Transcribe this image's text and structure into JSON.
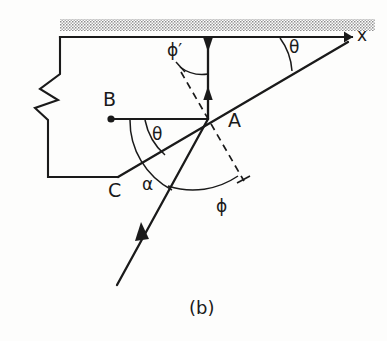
{
  "figure": {
    "caption": "(b)",
    "domain_type": "technical-line-diagram",
    "background_color": "#fdfdfc",
    "ink_color": "#1a1a1a",
    "hatch_color": "#9a9a9a",
    "labels": {
      "point_a": "A",
      "point_b": "B",
      "point_c": "C",
      "axis_x": "x",
      "angle_theta_upper": "θ",
      "angle_theta_lower": "θ",
      "angle_alpha": "α",
      "angle_phi": "ϕ",
      "angle_phi_prime": "ϕ′"
    },
    "label_positions": {
      "point_a": {
        "x": 228,
        "y": 111
      },
      "point_b": {
        "x": 103,
        "y": 90
      },
      "point_c": {
        "x": 108,
        "y": 181
      },
      "axis_x": {
        "x": 357,
        "y": 27
      },
      "angle_theta_upper": {
        "x": 289,
        "y": 39
      },
      "angle_theta_lower": {
        "x": 152,
        "y": 126
      },
      "angle_alpha": {
        "x": 142,
        "y": 176
      },
      "angle_phi": {
        "x": 216,
        "y": 198
      },
      "angle_phi_prime": {
        "x": 167,
        "y": 42
      }
    },
    "geometry": {
      "point_a": {
        "x": 208,
        "y": 119
      },
      "point_b": {
        "x": 111,
        "y": 119
      },
      "point_c": {
        "x": 118,
        "y": 177
      },
      "surface_y": 37,
      "hatch_band": {
        "x": 60,
        "y": 19,
        "width": 315,
        "height": 12
      },
      "x_axis_arrow_tip": {
        "x": 352,
        "y": 37
      },
      "shallow_ray_end": {
        "x": 348,
        "y": 42
      },
      "steep_ray_end": {
        "x": 117,
        "y": 285
      },
      "dashed_line_top": {
        "x": 181,
        "y": 72
      },
      "dashed_line_bottom": {
        "x": 244,
        "y": 181
      }
    },
    "annotations": {
      "hatched_band_meaning": "free-surface-hatching",
      "vertical_double_arrow": "normal-direction-indicator",
      "break_symbol": "material-break-zigzag"
    }
  }
}
